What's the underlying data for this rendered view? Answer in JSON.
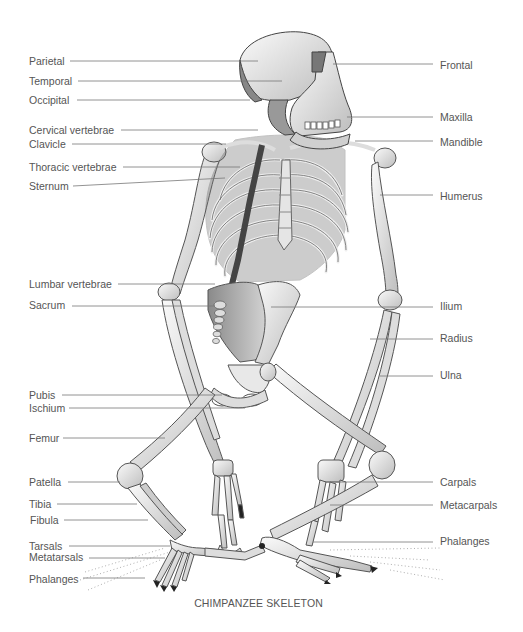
{
  "title": "CHIMPANZEE SKELETON",
  "labels_left": [
    {
      "id": "parietal",
      "text": "Parietal",
      "x": 29,
      "y": 58,
      "line_x1": 70,
      "line_x2": 258,
      "line_y": 61
    },
    {
      "id": "temporal",
      "text": "Temporal",
      "x": 29,
      "y": 78,
      "line_x1": 78,
      "line_x2": 282,
      "line_y": 81
    },
    {
      "id": "occipital",
      "text": "Occipital",
      "x": 29,
      "y": 97,
      "line_x1": 77,
      "line_x2": 250,
      "line_y": 100
    },
    {
      "id": "cervical-vertebrae",
      "text": "Cervical vertebrae",
      "x": 29,
      "y": 127,
      "line_x1": 121,
      "line_x2": 258,
      "line_y": 130
    },
    {
      "id": "clavicle",
      "text": "Clavicle",
      "x": 29,
      "y": 141,
      "line_x1": 72,
      "line_x2": 226,
      "line_y": 144
    },
    {
      "id": "thoracic-vertebrae",
      "text": "Thoracic vertebrae",
      "x": 29,
      "y": 164,
      "line_x1": 123,
      "line_x2": 240,
      "line_y": 167
    },
    {
      "id": "sternum",
      "text": "Sternum",
      "x": 29,
      "y": 183,
      "line_x1": 73,
      "line_x2": 225,
      "line_y": 186,
      "line_y2": 178
    },
    {
      "id": "lumbar-vertebrae",
      "text": "Lumbar vertebrae",
      "x": 29,
      "y": 281,
      "line_x1": 118,
      "line_x2": 215,
      "line_y": 284
    },
    {
      "id": "sacrum",
      "text": "Sacrum",
      "x": 29,
      "y": 302,
      "line_x1": 72,
      "line_x2": 215,
      "line_y": 306
    },
    {
      "id": "pubis",
      "text": "Pubis",
      "x": 29,
      "y": 392,
      "line_x1": 62,
      "line_x2": 222,
      "line_y": 395
    },
    {
      "id": "ischium",
      "text": "Ischium",
      "x": 29,
      "y": 405,
      "line_x1": 69,
      "line_x2": 245,
      "line_y": 408
    },
    {
      "id": "femur",
      "text": "Femur",
      "x": 29,
      "y": 435,
      "line_x1": 63,
      "line_x2": 165,
      "line_y": 438
    },
    {
      "id": "patella",
      "text": "Patella",
      "x": 29,
      "y": 479,
      "line_x1": 68,
      "line_x2": 120,
      "line_y": 482
    },
    {
      "id": "tibia",
      "text": "Tibia",
      "x": 29,
      "y": 501,
      "line_x1": 57,
      "line_x2": 137,
      "line_y": 504
    },
    {
      "id": "fibula",
      "text": "Fibula",
      "x": 30,
      "y": 517,
      "line_x1": 64,
      "line_x2": 148,
      "line_y": 520
    },
    {
      "id": "tarsals",
      "text": "Tarsals",
      "x": 29,
      "y": 543,
      "line_x1": 69,
      "line_x2": 170,
      "line_y": 546
    },
    {
      "id": "metatarsals",
      "text": "Metatarsals",
      "x": 29,
      "y": 554,
      "line_x1": 89,
      "line_x2": 165,
      "line_y": 558
    },
    {
      "id": "phalanges-foot",
      "text": "Phalanges",
      "x": 29,
      "y": 576,
      "line_x1": 83,
      "line_x2": 145,
      "line_y": 578
    }
  ],
  "labels_right": [
    {
      "id": "frontal",
      "text": "Frontal",
      "x": 440,
      "y": 62,
      "line_x1": 333,
      "line_x2": 433,
      "line_y": 64
    },
    {
      "id": "maxilla",
      "text": "Maxilla",
      "x": 440,
      "y": 113,
      "line_x1": 347,
      "line_x2": 433,
      "line_y": 117
    },
    {
      "id": "mandible",
      "text": "Mandible",
      "x": 440,
      "y": 139,
      "line_x1": 355,
      "line_x2": 433,
      "line_y": 141
    },
    {
      "id": "humerus",
      "text": "Humerus",
      "x": 440,
      "y": 193,
      "line_x1": 380,
      "line_x2": 433,
      "line_y": 195
    },
    {
      "id": "ilium",
      "text": "Ilium",
      "x": 440,
      "y": 303,
      "line_x1": 271,
      "line_x2": 433,
      "line_y": 307
    },
    {
      "id": "radius",
      "text": "Radius",
      "x": 440,
      "y": 335,
      "line_x1": 370,
      "line_x2": 433,
      "line_y": 339
    },
    {
      "id": "ulna",
      "text": "Ulna",
      "x": 440,
      "y": 372,
      "line_x1": 380,
      "line_x2": 433,
      "line_y": 376
    },
    {
      "id": "carpals",
      "text": "Carpals",
      "x": 440,
      "y": 479,
      "line_x1": 325,
      "line_x2": 433,
      "line_y": 482
    },
    {
      "id": "metacarpals",
      "text": "Metacarpals",
      "x": 440,
      "y": 502,
      "line_x1": 330,
      "line_x2": 433,
      "line_y": 505
    },
    {
      "id": "phalanges-hand",
      "text": "Phalanges",
      "x": 440,
      "y": 537,
      "line_x1": 313,
      "line_x2": 433,
      "line_y": 542
    }
  ],
  "colors": {
    "label_text": "#555555",
    "leader_line": "#777777",
    "bone_fill": "#eeeeee",
    "bone_stroke": "#555555",
    "bone_shade": "#9a9a9a"
  }
}
